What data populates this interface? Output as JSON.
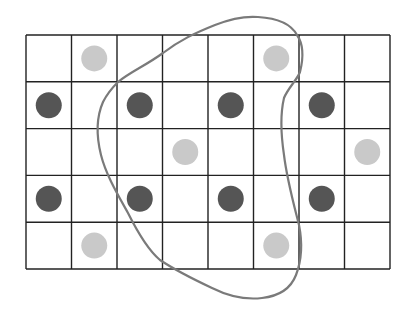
{
  "diagram": {
    "type": "grid-with-dots-and-closed-curve",
    "background": "#ffffff",
    "grid": {
      "rows": 5,
      "cols": 8,
      "x_lines": [
        26,
        71.5,
        117,
        162.5,
        208,
        253.5,
        299,
        344.5,
        390
      ],
      "y_lines": [
        35,
        81.8,
        128.6,
        175.4,
        222.2,
        269
      ],
      "line_color": "#222222",
      "line_width": 1.4
    },
    "dot_radius": 13,
    "dot_colors": {
      "dark": "#555555",
      "light": "#c9c9c9"
    },
    "dots": [
      {
        "row": 1,
        "col": 2,
        "shade": "light"
      },
      {
        "row": 1,
        "col": 6,
        "shade": "light"
      },
      {
        "row": 2,
        "col": 1,
        "shade": "dark"
      },
      {
        "row": 2,
        "col": 3,
        "shade": "dark"
      },
      {
        "row": 2,
        "col": 5,
        "shade": "dark"
      },
      {
        "row": 2,
        "col": 7,
        "shade": "dark"
      },
      {
        "row": 3,
        "col": 4,
        "shade": "light"
      },
      {
        "row": 3,
        "col": 8,
        "shade": "light"
      },
      {
        "row": 4,
        "col": 1,
        "shade": "dark"
      },
      {
        "row": 4,
        "col": 3,
        "shade": "dark"
      },
      {
        "row": 4,
        "col": 5,
        "shade": "dark"
      },
      {
        "row": 4,
        "col": 7,
        "shade": "dark"
      },
      {
        "row": 5,
        "col": 2,
        "shade": "light"
      },
      {
        "row": 5,
        "col": 6,
        "shade": "light"
      }
    ],
    "closed_curve": {
      "color": "#7a7a7a",
      "width": 2.2,
      "path": "M 118 82 C 130 72, 145 66, 163 53 C 180 40, 195 33, 215 25 C 230 19, 245 16, 258 17 C 275 18, 290 22, 297 35 C 304 45, 303 60, 300 72 C 297 80, 288 88, 284 98 C 280 115, 281 135, 284 155 C 287 180, 294 205, 299 225 C 303 245, 301 262, 296 275 C 291 288, 280 296, 262 298 C 245 300, 228 296, 212 288 C 195 280, 175 270, 160 260 C 148 250, 138 233, 128 213 C 118 195, 106 175, 101 155 C 96 135, 96 118, 103 102 C 107 94, 112 88, 118 82 Z"
    }
  }
}
